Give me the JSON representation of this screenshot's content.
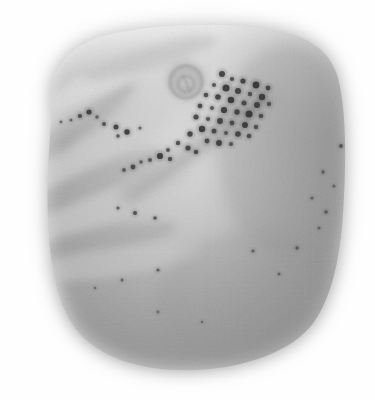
{
  "image": {
    "kind": "grayscale-specimen-micrograph",
    "width": 375,
    "height": 400,
    "background_color": "#fefefe",
    "artifact_mark": "o",
    "palette": {
      "background": "#fefefe",
      "body_light": "#e2e2e2",
      "body_mid": "#b4b4b4",
      "body_dark": "#8d8d8d",
      "body_darkest": "#747474",
      "ridge_shadow": "#9a9a9a",
      "ridge_highlight": "#d5d5d5",
      "spot_dark": "#2e2e2e",
      "spot_mid": "#4a4a4a",
      "spot_soft": "#5e5e5e"
    }
  },
  "specimen": {
    "name": "specimen-body",
    "outline_description": "rounded square blob with soft feathered edges, widest across the middle, rounded bottom",
    "tone_center": "#a8a8a8",
    "tone_top": "#e0e0e0",
    "tone_bottom": "#9c9c9c"
  },
  "features": {
    "ridges": [
      {
        "name": "ridge-band-1",
        "cx": 88,
        "cy": 96,
        "w": 150,
        "h": 34,
        "rot": -38,
        "tone": "#cfcfcf",
        "opacity": 0.72
      },
      {
        "name": "ridge-band-2",
        "cx": 74,
        "cy": 128,
        "w": 150,
        "h": 24,
        "rot": -36,
        "tone": "#9f9f9f",
        "opacity": 0.48
      },
      {
        "name": "ridge-band-3",
        "cx": 96,
        "cy": 150,
        "w": 165,
        "h": 30,
        "rot": -30,
        "tone": "#cccccc",
        "opacity": 0.66
      },
      {
        "name": "ridge-band-4",
        "cx": 84,
        "cy": 186,
        "w": 170,
        "h": 26,
        "rot": -24,
        "tone": "#9b9b9b",
        "opacity": 0.46
      },
      {
        "name": "ridge-band-5",
        "cx": 104,
        "cy": 208,
        "w": 180,
        "h": 30,
        "rot": -20,
        "tone": "#c9c9c9",
        "opacity": 0.62
      },
      {
        "name": "ridge-band-6",
        "cx": 92,
        "cy": 244,
        "w": 175,
        "h": 26,
        "rot": -12,
        "tone": "#989898",
        "opacity": 0.44
      },
      {
        "name": "ridge-band-7",
        "cx": 112,
        "cy": 262,
        "w": 185,
        "h": 30,
        "rot": -8,
        "tone": "#c6c6c6",
        "opacity": 0.58
      }
    ],
    "circular_depression": {
      "name": "circular-depression",
      "cx": 186,
      "cy": 82,
      "r_outer": 20,
      "r_inner": 11,
      "rim_tone": "#9b9b9b",
      "core_tone": "#a6a6a6"
    },
    "diagonal_streak": {
      "name": "inclusion-streak",
      "from_x": 145,
      "from_y": 175,
      "to_x": 265,
      "to_y": 92,
      "tone": "#9a9a9a"
    },
    "spot_clusters": [
      {
        "name": "main-cluster-upper-right",
        "count": 41
      },
      {
        "name": "linear-cluster-left-ridge",
        "count": 9
      },
      {
        "name": "scattered-dots-right",
        "count": 12
      }
    ],
    "spots": [
      {
        "x": 222,
        "y": 74,
        "r": 3.0,
        "tone": "#343434"
      },
      {
        "x": 232,
        "y": 79,
        "r": 2.1,
        "tone": "#3d3d3d"
      },
      {
        "x": 243,
        "y": 81,
        "r": 2.6,
        "tone": "#313131"
      },
      {
        "x": 256,
        "y": 85,
        "r": 3.4,
        "tone": "#2b2b2b"
      },
      {
        "x": 268,
        "y": 88,
        "r": 2.4,
        "tone": "#383838"
      },
      {
        "x": 214,
        "y": 85,
        "r": 2.0,
        "tone": "#474747"
      },
      {
        "x": 226,
        "y": 88,
        "r": 3.6,
        "tone": "#2d2d2d"
      },
      {
        "x": 238,
        "y": 91,
        "r": 3.0,
        "tone": "#333333"
      },
      {
        "x": 250,
        "y": 94,
        "r": 2.2,
        "tone": "#404040"
      },
      {
        "x": 262,
        "y": 97,
        "r": 3.2,
        "tone": "#2f2f2f"
      },
      {
        "x": 206,
        "y": 95,
        "r": 2.3,
        "tone": "#414141"
      },
      {
        "x": 218,
        "y": 97,
        "r": 2.8,
        "tone": "#363636"
      },
      {
        "x": 231,
        "y": 100,
        "r": 3.3,
        "tone": "#2c2c2c"
      },
      {
        "x": 244,
        "y": 103,
        "r": 2.5,
        "tone": "#3a3a3a"
      },
      {
        "x": 257,
        "y": 105,
        "r": 3.0,
        "tone": "#313131"
      },
      {
        "x": 269,
        "y": 104,
        "r": 2.2,
        "tone": "#444444"
      },
      {
        "x": 200,
        "y": 106,
        "r": 2.4,
        "tone": "#3e3e3e"
      },
      {
        "x": 212,
        "y": 108,
        "r": 2.0,
        "tone": "#484848"
      },
      {
        "x": 224,
        "y": 110,
        "r": 3.1,
        "tone": "#2e2e2e"
      },
      {
        "x": 237,
        "y": 112,
        "r": 2.7,
        "tone": "#353535"
      },
      {
        "x": 249,
        "y": 114,
        "r": 3.5,
        "tone": "#292929"
      },
      {
        "x": 261,
        "y": 116,
        "r": 2.3,
        "tone": "#3f3f3f"
      },
      {
        "x": 196,
        "y": 117,
        "r": 2.6,
        "tone": "#3a3a3a"
      },
      {
        "x": 208,
        "y": 119,
        "r": 2.1,
        "tone": "#464646"
      },
      {
        "x": 220,
        "y": 121,
        "r": 2.9,
        "tone": "#323232"
      },
      {
        "x": 232,
        "y": 123,
        "r": 2.4,
        "tone": "#3c3c3c"
      },
      {
        "x": 245,
        "y": 125,
        "r": 3.0,
        "tone": "#2f2f2f"
      },
      {
        "x": 256,
        "y": 127,
        "r": 2.2,
        "tone": "#424242"
      },
      {
        "x": 202,
        "y": 129,
        "r": 3.2,
        "tone": "#2d2d2d"
      },
      {
        "x": 214,
        "y": 131,
        "r": 2.5,
        "tone": "#393939"
      },
      {
        "x": 226,
        "y": 133,
        "r": 2.0,
        "tone": "#474747"
      },
      {
        "x": 238,
        "y": 134,
        "r": 2.8,
        "tone": "#343434"
      },
      {
        "x": 249,
        "y": 136,
        "r": 2.3,
        "tone": "#404040"
      },
      {
        "x": 190,
        "y": 134,
        "r": 2.7,
        "tone": "#373737"
      },
      {
        "x": 207,
        "y": 141,
        "r": 2.4,
        "tone": "#3b3b3b"
      },
      {
        "x": 219,
        "y": 143,
        "r": 2.9,
        "tone": "#303030"
      },
      {
        "x": 231,
        "y": 144,
        "r": 2.1,
        "tone": "#454545"
      },
      {
        "x": 178,
        "y": 143,
        "r": 2.2,
        "tone": "#424242"
      },
      {
        "x": 188,
        "y": 148,
        "r": 2.6,
        "tone": "#383838"
      },
      {
        "x": 168,
        "y": 150,
        "r": 2.0,
        "tone": "#4a4a4a"
      },
      {
        "x": 196,
        "y": 152,
        "r": 2.3,
        "tone": "#3e3e3e"
      },
      {
        "x": 160,
        "y": 156,
        "r": 3.1,
        "tone": "#2e2e2e"
      },
      {
        "x": 170,
        "y": 159,
        "r": 2.2,
        "tone": "#434343"
      },
      {
        "x": 150,
        "y": 160,
        "r": 2.0,
        "tone": "#4c4c4c"
      },
      {
        "x": 141,
        "y": 162,
        "r": 1.8,
        "tone": "#525252"
      },
      {
        "x": 133,
        "y": 167,
        "r": 2.4,
        "tone": "#3d3d3d"
      },
      {
        "x": 124,
        "y": 170,
        "r": 1.9,
        "tone": "#4e4e4e"
      },
      {
        "x": 80,
        "y": 116,
        "r": 2.1,
        "tone": "#3b3b3b"
      },
      {
        "x": 89,
        "y": 112,
        "r": 2.6,
        "tone": "#303030"
      },
      {
        "x": 97,
        "y": 117,
        "r": 1.7,
        "tone": "#545454"
      },
      {
        "x": 71,
        "y": 120,
        "r": 1.5,
        "tone": "#5c5c5c"
      },
      {
        "x": 104,
        "y": 124,
        "r": 2.0,
        "tone": "#454545"
      },
      {
        "x": 116,
        "y": 127,
        "r": 2.5,
        "tone": "#343434"
      },
      {
        "x": 127,
        "y": 132,
        "r": 2.7,
        "tone": "#2f2f2f"
      },
      {
        "x": 118,
        "y": 136,
        "r": 1.8,
        "tone": "#4f4f4f"
      },
      {
        "x": 61,
        "y": 122,
        "r": 1.4,
        "tone": "#5f5f5f"
      },
      {
        "x": 140,
        "y": 128,
        "r": 1.6,
        "tone": "#585858"
      },
      {
        "x": 341,
        "y": 146,
        "r": 1.9,
        "tone": "#4a4a4a"
      },
      {
        "x": 323,
        "y": 172,
        "r": 1.7,
        "tone": "#505050"
      },
      {
        "x": 334,
        "y": 186,
        "r": 1.5,
        "tone": "#585858"
      },
      {
        "x": 312,
        "y": 198,
        "r": 1.6,
        "tone": "#545454"
      },
      {
        "x": 326,
        "y": 212,
        "r": 1.8,
        "tone": "#4d4d4d"
      },
      {
        "x": 319,
        "y": 228,
        "r": 1.5,
        "tone": "#595959"
      },
      {
        "x": 297,
        "y": 248,
        "r": 1.7,
        "tone": "#505050"
      },
      {
        "x": 253,
        "y": 251,
        "r": 1.6,
        "tone": "#555555"
      },
      {
        "x": 279,
        "y": 274,
        "r": 1.5,
        "tone": "#5a5a5a"
      },
      {
        "x": 135,
        "y": 213,
        "r": 2.0,
        "tone": "#444444"
      },
      {
        "x": 155,
        "y": 218,
        "r": 1.8,
        "tone": "#4b4b4b"
      },
      {
        "x": 118,
        "y": 208,
        "r": 1.6,
        "tone": "#555555"
      },
      {
        "x": 158,
        "y": 270,
        "r": 1.6,
        "tone": "#535353"
      },
      {
        "x": 122,
        "y": 280,
        "r": 1.5,
        "tone": "#5a5a5a"
      },
      {
        "x": 158,
        "y": 312,
        "r": 1.4,
        "tone": "#5e5e5e"
      },
      {
        "x": 95,
        "y": 288,
        "r": 1.3,
        "tone": "#626262"
      },
      {
        "x": 202,
        "y": 322,
        "r": 1.3,
        "tone": "#646464"
      }
    ]
  }
}
